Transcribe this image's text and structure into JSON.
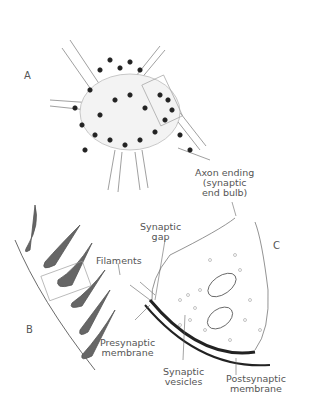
{
  "figure": {
    "panels": {
      "a": "A",
      "b": "B",
      "c": "C"
    },
    "labels": {
      "axon_ending_1": "Axon ending",
      "axon_ending_2": "(synaptic",
      "axon_ending_3": "end bulb)",
      "synaptic_gap_1": "Synaptic",
      "synaptic_gap_2": "gap",
      "filaments": "Filaments",
      "presynaptic_1": "Presynaptic",
      "presynaptic_2": "membrane",
      "vesicles_1": "Synaptic",
      "vesicles_2": "vesicles",
      "postsynaptic_1": "Postsynaptic",
      "postsynaptic_2": "membrane"
    },
    "colors": {
      "ink": "#222222",
      "label": "#555555",
      "shade": "#bbbbbb"
    }
  }
}
